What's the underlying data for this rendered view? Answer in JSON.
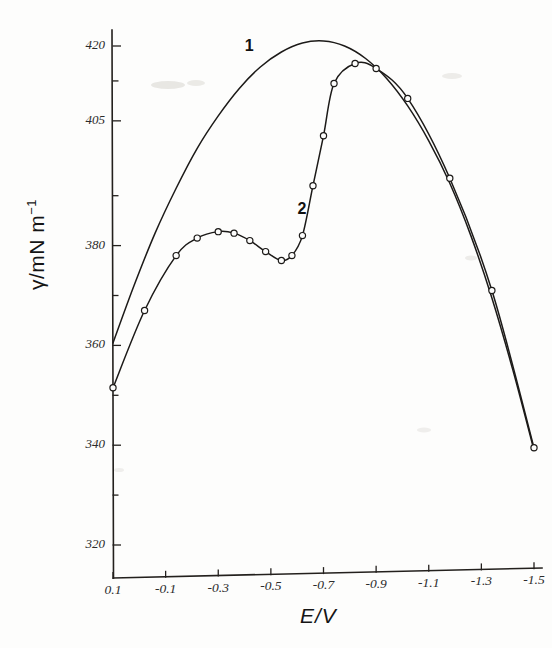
{
  "chart_data": {
    "type": "line",
    "title": "",
    "xlabel": "E/V",
    "ylabel": "γ/mN m",
    "ylabel_exponent": "−1",
    "xlim": [
      0.1,
      -1.5
    ],
    "ylim": [
      315,
      424
    ],
    "grid": false,
    "legend_position": "inline-annotations",
    "xticks": [
      "0.1",
      "-0.1",
      "-0.3",
      "-0.5",
      "-0.7",
      "-0.9",
      "-1.1",
      "-1.3",
      "-1.5"
    ],
    "xtick_values": [
      0.1,
      -0.1,
      -0.3,
      -0.5,
      -0.7,
      -0.9,
      -1.1,
      -1.3,
      -1.5
    ],
    "yticks": [
      "420",
      "405",
      "380",
      "360",
      "340",
      "320"
    ],
    "ytick_values": [
      420,
      405,
      380,
      360,
      340,
      320
    ],
    "yminor_values": [
      413,
      390,
      370,
      350,
      330
    ],
    "series": [
      {
        "name": "1",
        "label": "1",
        "markers": false,
        "annotation_x": -0.42,
        "annotation_y": 419.5,
        "x": [
          0.1,
          0.02,
          -0.06,
          -0.14,
          -0.22,
          -0.3,
          -0.38,
          -0.46,
          -0.54,
          -0.62,
          -0.7,
          -0.78,
          -0.86,
          -0.94,
          -1.02,
          -1.1,
          -1.18,
          -1.26,
          -1.34,
          -1.42,
          -1.5
        ],
        "y": [
          360.5,
          372.0,
          382.5,
          391.5,
          399.5,
          406.0,
          411.5,
          415.8,
          418.8,
          420.6,
          421.0,
          420.0,
          417.5,
          413.5,
          408.0,
          401.0,
          392.5,
          382.0,
          369.5,
          355.0,
          339.0
        ]
      },
      {
        "name": "2",
        "label": "2",
        "markers": true,
        "marker_style": "open-circle",
        "annotation_x": -0.62,
        "annotation_y": 387.0,
        "x": [
          0.1,
          -0.02,
          -0.14,
          -0.22,
          -0.3,
          -0.36,
          -0.42,
          -0.48,
          -0.54,
          -0.58,
          -0.62,
          -0.66,
          -0.7,
          -0.74,
          -0.82,
          -0.9,
          -1.02,
          -1.18,
          -1.34,
          -1.5
        ],
        "y": [
          351.5,
          367.0,
          378.0,
          381.5,
          382.8,
          382.5,
          381.0,
          378.8,
          377.0,
          378.0,
          382.0,
          392.0,
          402.0,
          412.5,
          416.5,
          415.5,
          409.5,
          393.5,
          371.0,
          339.5
        ]
      }
    ]
  },
  "axis_titles": {
    "y_main": "γ/mN m",
    "y_exponent": "−1",
    "x": "E/V"
  },
  "annotations": {
    "curve_one": "1",
    "curve_two": "2"
  }
}
